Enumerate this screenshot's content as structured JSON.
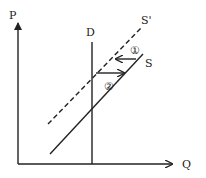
{
  "diagram": {
    "type": "supply-demand",
    "axes": {
      "y_label": "P",
      "x_label": "Q"
    },
    "curves": [
      {
        "id": "D",
        "label": "D",
        "style": "solid",
        "orientation": "vertical"
      },
      {
        "id": "S",
        "label": "S",
        "style": "solid"
      },
      {
        "id": "S_prime",
        "label": "S'",
        "style": "dashed"
      }
    ],
    "arrows": [
      {
        "id": "1",
        "label": "①",
        "direction": "left"
      },
      {
        "id": "2",
        "label": "②",
        "direction": "right"
      }
    ],
    "colors": {
      "line": "#222222",
      "background": "#ffffff"
    }
  }
}
